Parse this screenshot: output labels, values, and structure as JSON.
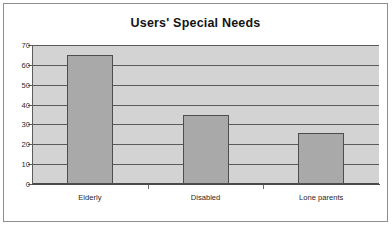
{
  "chart_data": {
    "type": "bar",
    "title": "Users' Special Needs",
    "categories": [
      "Elderly",
      "Disabled",
      "Lone parents"
    ],
    "values": [
      65,
      35,
      25.5
    ],
    "xlabel": "",
    "ylabel": "",
    "ylim": [
      0,
      70
    ],
    "ytick_step": 10,
    "yticks": [
      0,
      10,
      20,
      30,
      40,
      50,
      60,
      70
    ],
    "ytick_labels": [
      "0",
      "10",
      "20",
      "30",
      "40",
      "50",
      "60",
      "70"
    ],
    "grid": true,
    "legend": false,
    "legend_position": "none",
    "colors": {
      "bar_fill": "#a9a9a9",
      "bar_border": "#4d4d4d",
      "plot_background": "#d3d3d3",
      "gridline": "#5b5b5b",
      "axis": "#4a4a4a",
      "title_text": "#141414",
      "tick_text": "#2b2b2b",
      "frame_border": "#8d8d8d",
      "page_background": "#ffffff"
    }
  }
}
